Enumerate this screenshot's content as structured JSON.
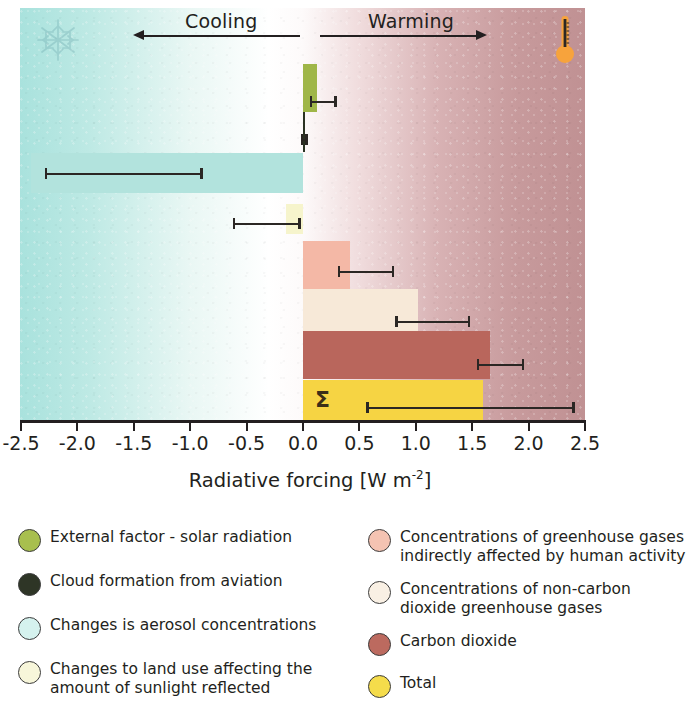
{
  "figure": {
    "axis_title": "Radiative forcing [W m",
    "axis_title_exp": "-2",
    "axis_title_end": "]",
    "direction_left": "Cooling",
    "direction_right": "Warming",
    "total_symbol": "Σ",
    "decor_snowflake": "snowflake-icon",
    "decor_thermometer": "thermometer-icon"
  },
  "chart_data": {
    "type": "bar",
    "orientation": "horizontal",
    "title": "",
    "xlabel": "Radiative forcing [W m-2]",
    "ylabel": "",
    "xlim": [
      -2.5,
      2.5
    ],
    "xticks": [
      "-2.5",
      "-2.0",
      "-1.5",
      "-1.0",
      "-0.5",
      "0.0",
      "0.5",
      "1.0",
      "1.5",
      "2.0",
      "2.5"
    ],
    "xtick_values": [
      -2.5,
      -2.0,
      -1.5,
      -1.0,
      -0.5,
      0.0,
      0.5,
      1.0,
      1.5,
      2.0,
      2.5
    ],
    "grid": false,
    "legend_position": "below",
    "zero_line": 0.0,
    "categories": [
      "External factor - solar radiation",
      "Cloud formation from aviation",
      "Changes is aerosol concentrations",
      "Changes to land use affecting the amount of sunlight reflected",
      "Concentrations of greenhouse gases indirectly affected by human activity",
      "Concentrations of non-carbon dioxide greenhouse gases",
      "Carbon dioxide",
      "Total"
    ],
    "values": [
      0.12,
      0.01,
      -2.41,
      -0.15,
      0.42,
      1.02,
      1.66,
      1.6
    ],
    "error_low": [
      0.06,
      -0.02,
      -5.0,
      -0.62,
      0.19,
      0.95,
      2.08,
      1.05
    ],
    "error_high": [
      0.3,
      0.04,
      -0.89,
      -0.02,
      0.8,
      1.48,
      2.42,
      2.41
    ],
    "bars": [
      {
        "label": "External factor - solar radiation",
        "value": 0.12,
        "err_low": 0.06,
        "err_high": 0.3,
        "color": "#9fb648"
      },
      {
        "label": "Cloud formation from aviation",
        "value": 0.01,
        "err_low": -0.02,
        "err_high": 0.04,
        "color": "#2b3323"
      },
      {
        "label": "Changes is aerosol concentrations",
        "value": -2.41,
        "err_low": -2.29,
        "err_high": -0.89,
        "color": "#b2e3dd"
      },
      {
        "label": "Changes to land use affecting the amount of sunlight reflected",
        "value": -0.15,
        "err_low": -0.62,
        "err_high": -0.02,
        "color": "#f6f4cc"
      },
      {
        "label": "Concentrations of greenhouse gases indirectly affected by human activity",
        "value": 0.42,
        "err_low": 0.31,
        "err_high": 0.81,
        "color": "#f4b8a6"
      },
      {
        "label": "Concentrations of non-carbon dioxide greenhouse gases",
        "value": 1.02,
        "err_low": 0.82,
        "err_high": 1.48,
        "color": "#f7e9d8"
      },
      {
        "label": "Carbon dioxide",
        "value": 1.66,
        "err_low": 1.54,
        "err_high": 1.96,
        "color": "#b9665c"
      },
      {
        "label": "Total",
        "value": 1.6,
        "err_low": 0.56,
        "err_high": 2.41,
        "color": "#f6d443"
      }
    ]
  },
  "legend": {
    "left_items": [
      {
        "label": "External factor - solar radiation",
        "color": "#a8bf4e"
      },
      {
        "label": "Cloud formation from aviation",
        "color": "#2e3526"
      },
      {
        "label": "Changes is aerosol concentrations",
        "color": "#d5f2ee"
      },
      {
        "label": "Changes to land use affecting the\namount of sunlight reflected",
        "color": "#f7f6da"
      }
    ],
    "right_items": [
      {
        "label": "Concentrations of greenhouse gases\nindirectly affected by human activity",
        "color": "#f4c3b2"
      },
      {
        "label": "Concentrations of non-carbon\ndioxide greenhouse gases",
        "color": "#f9f0e4"
      },
      {
        "label": "Carbon dioxide",
        "color": "#bc6a5f"
      },
      {
        "label": "Total",
        "color": "#f5dc4b"
      }
    ]
  }
}
